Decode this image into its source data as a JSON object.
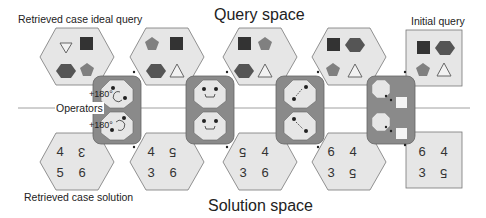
{
  "labels": {
    "query_space": "Query space",
    "solution_space": "Solution space",
    "retrieved_case_ideal_query": "Retrieved case ideal query",
    "retrieved_case_solution": "Retrieved case solution",
    "initial_query": "Initial query",
    "operators": "Operators",
    "rotation_1": "+180°",
    "rotation_2": "+180°"
  },
  "colors": {
    "panel_fill": "#e6e6e6",
    "panel_stroke": "#777777",
    "operator_fill": "#8a8a8a",
    "square": "#333333",
    "hexagon_shape": "#555555",
    "pentagon": "#808080",
    "triangle_stroke": "#666666"
  },
  "query_panels": [
    {
      "shape": "hexagon",
      "cells": [
        "triangle-down",
        "square",
        "hexagon",
        "pentagon"
      ]
    },
    {
      "shape": "hexagon",
      "cells": [
        "pentagon",
        "square",
        "hexagon",
        "triangle"
      ]
    },
    {
      "shape": "hexagon",
      "cells": [
        "square",
        "pentagon",
        "hexagon",
        "triangle"
      ]
    },
    {
      "shape": "hexagon",
      "cells": [
        "square",
        "hexagon",
        "pentagon",
        "triangle"
      ]
    },
    {
      "shape": "square",
      "cells": [
        "square",
        "hexagon",
        "pentagon",
        "triangle"
      ]
    }
  ],
  "solution_panels": [
    {
      "shape": "hexagon",
      "cells": [
        {
          "v": "4",
          "flip": false
        },
        {
          "v": "3",
          "flip": true
        },
        {
          "v": "5",
          "flip": false
        },
        {
          "v": "6",
          "flip": false
        }
      ]
    },
    {
      "shape": "hexagon",
      "cells": [
        {
          "v": "4",
          "flip": false
        },
        {
          "v": "5",
          "flip": true
        },
        {
          "v": "3",
          "flip": false
        },
        {
          "v": "6",
          "flip": false
        }
      ]
    },
    {
      "shape": "hexagon",
      "cells": [
        {
          "v": "5",
          "flip": true
        },
        {
          "v": "4",
          "flip": false
        },
        {
          "v": "3",
          "flip": false
        },
        {
          "v": "6",
          "flip": false
        }
      ]
    },
    {
      "shape": "hexagon",
      "cells": [
        {
          "v": "6",
          "flip": false
        },
        {
          "v": "4",
          "flip": false
        },
        {
          "v": "3",
          "flip": false
        },
        {
          "v": "5",
          "flip": true
        }
      ]
    },
    {
      "shape": "square",
      "cells": [
        {
          "v": "6",
          "flip": false
        },
        {
          "v": "4",
          "flip": false
        },
        {
          "v": "3",
          "flip": false
        },
        {
          "v": "5",
          "flip": true
        }
      ]
    }
  ],
  "operators": [
    {
      "type": "rotate-180"
    },
    {
      "type": "swap-horizontal"
    },
    {
      "type": "swap-diagonal"
    },
    {
      "type": "move-element"
    }
  ]
}
